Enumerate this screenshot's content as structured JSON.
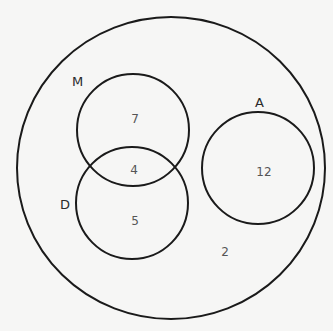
{
  "diagram": {
    "type": "venn",
    "universe": {
      "remainder_label": "2"
    },
    "sets": [
      {
        "id": "M",
        "label": "M"
      },
      {
        "id": "D",
        "label": "D"
      },
      {
        "id": "A",
        "label": "A"
      }
    ],
    "regions": {
      "M_only": "7",
      "M_and_D": "4",
      "D_only": "5",
      "A_only": "12",
      "outside_all": "2"
    },
    "colors": {
      "stroke": "#1a1a1a",
      "background": "#f6f6f5",
      "text": "#555555"
    }
  }
}
